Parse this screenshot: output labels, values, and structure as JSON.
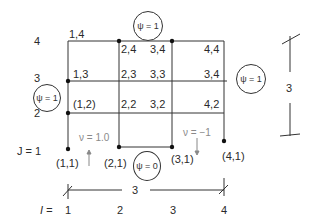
{
  "grid": {
    "j_labels": [
      "J = 1",
      "2",
      "3",
      "4"
    ],
    "i_label_prefix": "I =",
    "i_labels": [
      "1",
      "2",
      "3",
      "4"
    ],
    "nodes": {
      "n14": "1,4",
      "n24": "2,4",
      "n34": "3,4",
      "n44": "4,4",
      "n13": "1,3",
      "n23": "2,3",
      "n33": "3,3",
      "n34b": "3,4",
      "n12": "(1,2)",
      "n22": "2,2",
      "n32": "3,2",
      "n42": "4,2",
      "n11": "(1,1)",
      "n21": "(2,1)",
      "n31": "(3,1)",
      "n41": "(4,1)"
    }
  },
  "boundary_conditions": {
    "top": "ψ = 1",
    "left": "ψ = 1",
    "right": "ψ = 1",
    "bottom": "ψ = 0"
  },
  "flow": {
    "inlet": "ν = 1.0",
    "outlet": "ν = −1"
  },
  "dimensions": {
    "width": "3",
    "height": "3"
  }
}
